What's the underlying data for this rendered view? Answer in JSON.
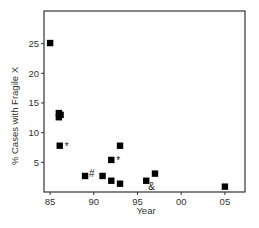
{
  "chart_data": {
    "type": "scatter",
    "title": "",
    "xlabel": "Year",
    "ylabel": "% Cases with Fragile X",
    "xlim": [
      84.3,
      107.3
    ],
    "ylim": [
      0,
      30.5
    ],
    "grid": false,
    "legend": null,
    "x_ticks": [
      {
        "value": 85,
        "label": "85"
      },
      {
        "value": 90,
        "label": "90"
      },
      {
        "value": 95,
        "label": "95"
      },
      {
        "value": 100,
        "label": "00"
      },
      {
        "value": 105,
        "label": "05"
      }
    ],
    "y_ticks": [
      {
        "value": 5,
        "label": "5"
      },
      {
        "value": 10,
        "label": "10"
      },
      {
        "value": 15,
        "label": "15"
      },
      {
        "value": 20,
        "label": "20"
      },
      {
        "value": 25,
        "label": "25"
      }
    ],
    "series": [
      {
        "name": "studies",
        "marker": "square",
        "color": "#000000",
        "points": [
          {
            "x": 85,
            "y": 25.1,
            "annotation": ""
          },
          {
            "x": 86,
            "y": 13.3,
            "annotation": ""
          },
          {
            "x": 86.2,
            "y": 13.0,
            "annotation": ""
          },
          {
            "x": 86,
            "y": 12.6,
            "annotation": ""
          },
          {
            "x": 86.1,
            "y": 7.8,
            "annotation": "*"
          },
          {
            "x": 89,
            "y": 2.7,
            "annotation": "#"
          },
          {
            "x": 91,
            "y": 2.7,
            "annotation": ""
          },
          {
            "x": 92,
            "y": 5.4,
            "annotation": "*"
          },
          {
            "x": 92,
            "y": 1.9,
            "annotation": ""
          },
          {
            "x": 93,
            "y": 7.8,
            "annotation": ""
          },
          {
            "x": 93,
            "y": 1.4,
            "annotation": ""
          },
          {
            "x": 96,
            "y": 1.9,
            "annotation": "&"
          },
          {
            "x": 97,
            "y": 3.1,
            "annotation": ""
          },
          {
            "x": 105,
            "y": 0.9,
            "annotation": ""
          }
        ]
      }
    ]
  }
}
